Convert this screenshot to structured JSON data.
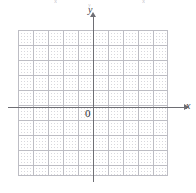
{
  "figure": {
    "type": "coordinate-plane",
    "origin_label": "0",
    "x_axis_label": "x",
    "y_axis_label": "y"
  },
  "artifacts": {
    "top_left": "x",
    "top_right": "x",
    "top_middle": "y"
  },
  "colors": {
    "background": "#ffffff",
    "grid_dot": "#d8d8dd",
    "grid_major": "#bdbdc4",
    "axis": "#6e6e74",
    "label": "#45454b",
    "origin_label": "#2e2e33"
  },
  "chart_data": {
    "type": "scatter",
    "title": "",
    "subtitle": "",
    "xlabel": "x",
    "ylabel": "y",
    "origin_label": "0",
    "grid": true,
    "grid_style": "dotted",
    "grid_cell_px": 15,
    "legend": null,
    "legend_position": "none",
    "annotations": [],
    "series": [],
    "x": [],
    "values": [],
    "xlim": [
      -5,
      5
    ],
    "ylim": [
      -5,
      5
    ],
    "x_tick_labels": [],
    "y_tick_labels": [],
    "x_gridline_count": 11,
    "y_gridline_count": 11
  }
}
